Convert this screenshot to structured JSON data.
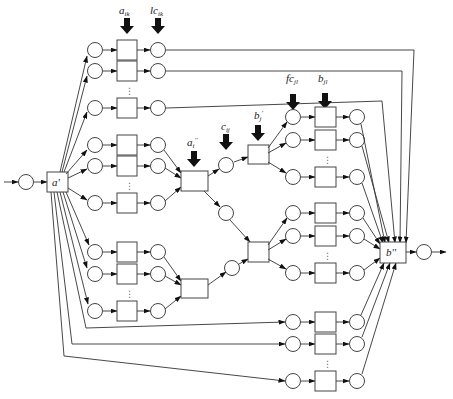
{
  "diagram": {
    "type": "petri-net",
    "labels": {
      "a_prime": "a'",
      "b_double": "b''",
      "a_ik": "a",
      "a_ik_sub": "ik",
      "lc_ik": "lc",
      "lc_ik_sub": "ik",
      "a_i_double": "a",
      "a_i_double_sub": "i",
      "a_i_double_sup": "''",
      "c_ij": "c",
      "c_ij_sub": "ij",
      "b_j_prime": "b",
      "b_j_prime_sub": "j",
      "b_j_prime_sup": "'",
      "fc_jl": "fc",
      "fc_jl_sub": "jl",
      "b_jl": "b",
      "b_jl_sub": "jl"
    },
    "colors": {
      "stroke": "#444444",
      "arrow": "#111111",
      "background": "#ffffff"
    },
    "left_rows_y": [
      50,
      71,
      108,
      145,
      166,
      203,
      252,
      274,
      311
    ],
    "right_rows_y": [
      117,
      140,
      177,
      213,
      236,
      273,
      322,
      344,
      381
    ]
  }
}
